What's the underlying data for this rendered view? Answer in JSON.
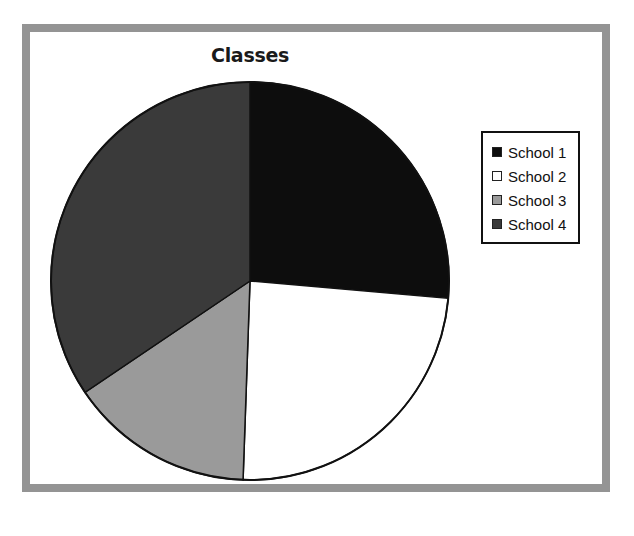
{
  "chart_data": {
    "type": "pie",
    "title": "Classes",
    "categories": [
      "School 1",
      "School 2",
      "School 3",
      "School 4"
    ],
    "values": [
      26.4,
      24.2,
      15.0,
      34.4
    ],
    "units": "percent",
    "start_angle_deg": 0,
    "direction": "clockwise",
    "slice_boundaries_deg": [
      0,
      95,
      182,
      236,
      360
    ],
    "colors": [
      "#0d0d0d",
      "#ffffff",
      "#9a9a9a",
      "#3a3a3a"
    ],
    "legend": {
      "position": "right",
      "entries": [
        {
          "label": "School 1",
          "color": "#0d0d0d"
        },
        {
          "label": "School 2",
          "color": "#ffffff"
        },
        {
          "label": "School 3",
          "color": "#9a9a9a"
        },
        {
          "label": "School 4",
          "color": "#3a3a3a"
        }
      ]
    },
    "xlabel": "",
    "ylabel": "",
    "grid": false,
    "data_labels_shown": false
  },
  "figure": {
    "frame_color": "#949494",
    "background_color": "#ffffff",
    "outline_color": "#111111"
  },
  "pie": {
    "center_x": 250,
    "center_y": 281,
    "radius": 199
  }
}
